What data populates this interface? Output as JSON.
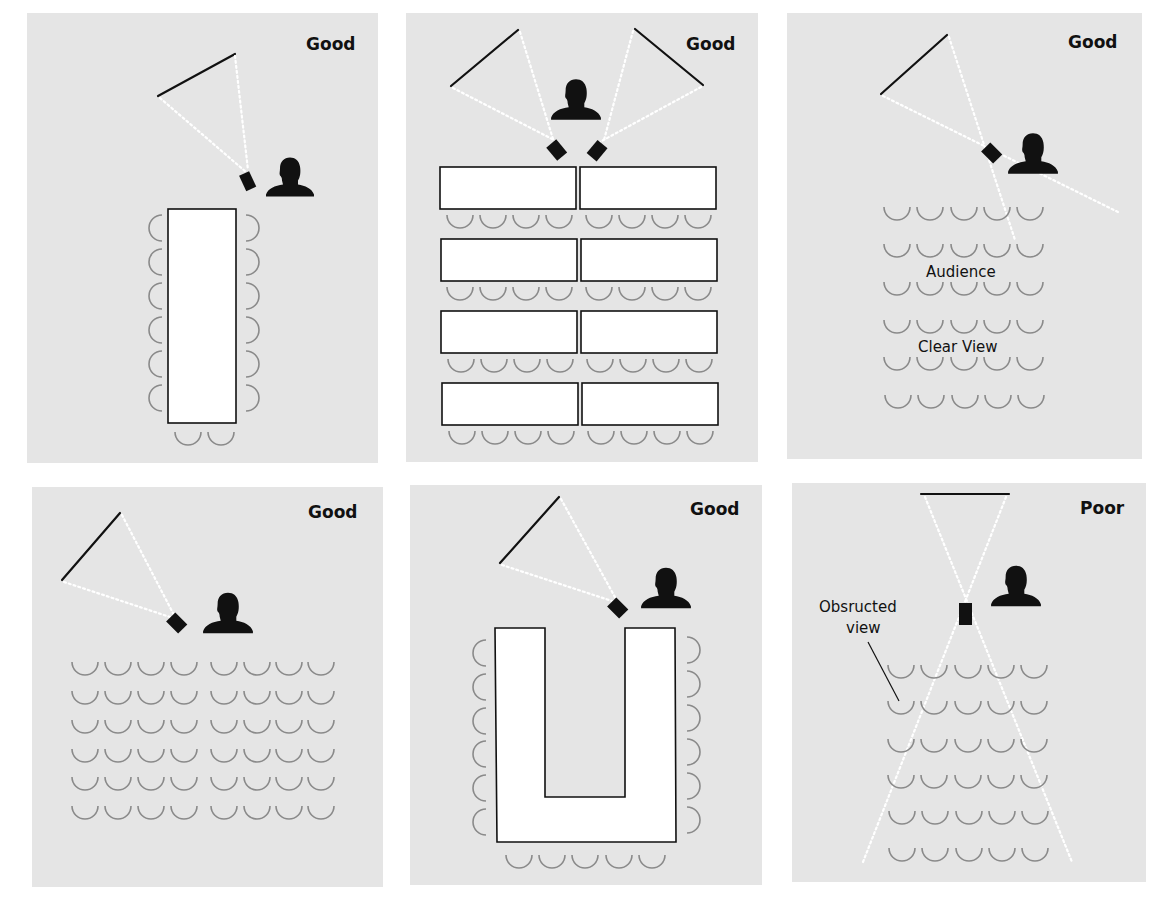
{
  "figure": {
    "colors": {
      "panel_background": "#e5e5e5",
      "seat_stroke": "#8a8a8a",
      "ink": "#111111",
      "beam": "#ffffff"
    }
  },
  "panels": [
    {
      "id": "p1",
      "rating": "Good",
      "layout": "boardroom-long-table",
      "rows_of_seats": 6,
      "seats_each_side": 6,
      "end_seats": 2
    },
    {
      "id": "p2",
      "rating": "Good",
      "layout": "classroom-tables-two-screens",
      "table_rows": 4,
      "tables_per_row": 2,
      "seats_per_row": 8,
      "screens": 2,
      "projectors": 2
    },
    {
      "id": "p3",
      "rating": "Good",
      "layout": "theater-corner-screen",
      "rows_of_seats": 6,
      "seats_per_row": 5,
      "labels": [
        "Audience",
        "Clear View"
      ]
    },
    {
      "id": "p4",
      "rating": "Good",
      "layout": "theater-wide-corner-screen",
      "rows_of_seats": 6,
      "seats_per_row": 8
    },
    {
      "id": "p5",
      "rating": "Good",
      "layout": "u-shape-table",
      "seats_each_side": 6,
      "bottom_seats": 5
    },
    {
      "id": "p6",
      "rating": "Poor",
      "layout": "theater-center-screen",
      "rows_of_seats": 6,
      "seats_per_row": 5,
      "labels": [
        "Obsructed",
        "view"
      ]
    }
  ],
  "text": {
    "p1_rating": "Good",
    "p2_rating": "Good",
    "p3_rating": "Good",
    "p3_label_audience": "Audience",
    "p3_label_clear": "Clear View",
    "p4_rating": "Good",
    "p5_rating": "Good",
    "p6_rating": "Poor",
    "p6_label_line1": "Obsructed",
    "p6_label_line2": "view"
  }
}
